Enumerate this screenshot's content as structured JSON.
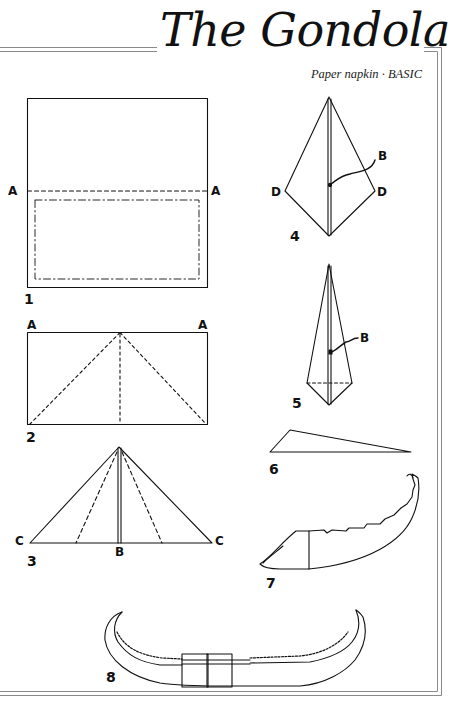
{
  "header": {
    "title": "The Gondola",
    "subtitle": "Paper napkin · BASIC"
  },
  "diagrams": [
    {
      "step": "1",
      "labels": [
        "A",
        "A"
      ]
    },
    {
      "step": "2",
      "labels": [
        "A",
        "A"
      ]
    },
    {
      "step": "3",
      "labels": [
        "C",
        "C",
        "B"
      ]
    },
    {
      "step": "4",
      "labels": [
        "D",
        "D",
        "B"
      ]
    },
    {
      "step": "5",
      "labels": [
        "B"
      ]
    },
    {
      "step": "6",
      "labels": []
    },
    {
      "step": "7",
      "labels": []
    },
    {
      "step": "8",
      "labels": []
    }
  ],
  "colors": {
    "ink": "#111111",
    "frame": "#8a8a8a",
    "background": "#ffffff"
  }
}
